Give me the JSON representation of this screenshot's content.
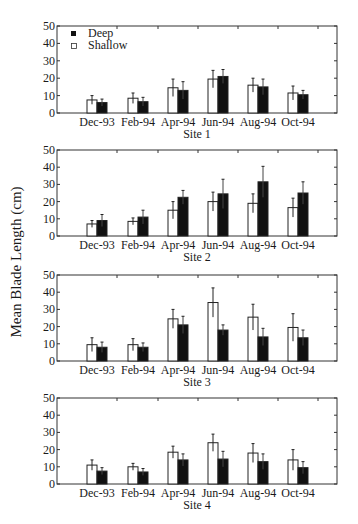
{
  "figure": {
    "ylabel": "Mean Blade Length (cm)",
    "legend": {
      "deep": "Deep",
      "shallow": "Shallow"
    }
  },
  "chart_data": [
    {
      "type": "bar",
      "title": "Site 1",
      "xlabel": "Site 1",
      "ylabel": "Mean Blade Length (cm)",
      "categories": [
        "Dec-93",
        "Feb-94",
        "Apr-94",
        "Jun-94",
        "Aug-94",
        "Oct-94"
      ],
      "ylim": [
        0,
        50
      ],
      "yticks": [
        0,
        10,
        20,
        30,
        40,
        50
      ],
      "legend": [
        "Deep",
        "Shallow"
      ],
      "legend_position": "upper left",
      "series": [
        {
          "name": "Shallow",
          "color": "#ffffff",
          "values": [
            7.5,
            8.5,
            14.5,
            19.5,
            16,
            11.5
          ],
          "error": [
            2.5,
            3,
            5,
            5,
            4,
            4
          ]
        },
        {
          "name": "Deep",
          "color": "#111111",
          "values": [
            6,
            6.5,
            13,
            21,
            15,
            10.5
          ],
          "error": [
            2,
            2.5,
            5,
            4,
            4.5,
            2.5
          ]
        }
      ]
    },
    {
      "type": "bar",
      "title": "Site 2",
      "xlabel": "Site 2",
      "ylabel": "Mean Blade Length (cm)",
      "categories": [
        "Dec-93",
        "Feb-94",
        "Apr-94",
        "Jun-94",
        "Aug-94",
        "Oct-94"
      ],
      "ylim": [
        0,
        50
      ],
      "yticks": [
        0,
        10,
        20,
        30,
        40,
        50
      ],
      "series": [
        {
          "name": "Shallow",
          "color": "#ffffff",
          "values": [
            7,
            8.5,
            15,
            20,
            19,
            16.5
          ],
          "error": [
            2,
            2,
            5,
            5.5,
            5.5,
            5.5
          ]
        },
        {
          "name": "Deep",
          "color": "#111111",
          "values": [
            9,
            11,
            22.5,
            24.5,
            31.5,
            25
          ],
          "error": [
            3.5,
            4,
            4,
            8.5,
            9,
            6.5
          ]
        }
      ]
    },
    {
      "type": "bar",
      "title": "Site 3",
      "xlabel": "Site 3",
      "ylabel": "Mean Blade Length (cm)",
      "categories": [
        "Dec-93",
        "Feb-94",
        "Apr-94",
        "Jun-94",
        "Aug-94",
        "Oct-94"
      ],
      "ylim": [
        0,
        50
      ],
      "yticks": [
        0,
        10,
        20,
        30,
        40,
        50
      ],
      "series": [
        {
          "name": "Shallow",
          "color": "#ffffff",
          "values": [
            9.5,
            9.5,
            24.5,
            34,
            25.5,
            19.5
          ],
          "error": [
            4,
            3.5,
            5.5,
            8.5,
            7.5,
            8
          ]
        },
        {
          "name": "Deep",
          "color": "#111111",
          "values": [
            8,
            8,
            21,
            18,
            14,
            13.5
          ],
          "error": [
            3,
            2.5,
            5,
            3,
            5,
            4.5
          ]
        }
      ]
    },
    {
      "type": "bar",
      "title": "Site 4",
      "xlabel": "Site 4",
      "ylabel": "Mean Blade Length (cm)",
      "categories": [
        "Dec-93",
        "Feb-94",
        "Apr-94",
        "Jun-94",
        "Aug-94",
        "Oct-94"
      ],
      "ylim": [
        0,
        50
      ],
      "yticks": [
        0,
        10,
        20,
        30,
        40,
        50
      ],
      "series": [
        {
          "name": "Shallow",
          "color": "#ffffff",
          "values": [
            11,
            10,
            18.5,
            24,
            18,
            14
          ],
          "error": [
            3,
            2,
            3.5,
            5,
            5.5,
            6
          ]
        },
        {
          "name": "Deep",
          "color": "#111111",
          "values": [
            7.5,
            7,
            14,
            14.5,
            13,
            9.5
          ],
          "error": [
            2,
            2,
            3.5,
            4.5,
            4.5,
            3.5
          ]
        }
      ]
    }
  ]
}
